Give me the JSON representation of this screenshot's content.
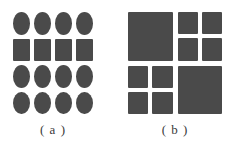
{
  "figure": {
    "background_color": "#ffffff",
    "shape_color": "#4a4a4a",
    "panels": [
      {
        "id": "a",
        "caption": "( a )",
        "description": "regular 4x4 lattice of shapes",
        "columns": 4,
        "rows": 4,
        "cells": [
          [
            "circle",
            "circle",
            "circle",
            "circle"
          ],
          [
            "square",
            "square",
            "square",
            "square"
          ],
          [
            "circle",
            "circle",
            "circle",
            "circle"
          ],
          [
            "circle",
            "circle",
            "circle",
            "circle"
          ]
        ]
      },
      {
        "id": "b",
        "caption": "( b )",
        "description": "quadtree subdivision of a square into four quadrants, two of which are further split into four sub-blocks",
        "quadrants": [
          {
            "position": "top-left",
            "type": "leaf",
            "children": []
          },
          {
            "position": "top-right",
            "type": "split",
            "children": [
              "top-left",
              "top-right",
              "bottom-left",
              "bottom-right"
            ]
          },
          {
            "position": "bottom-left",
            "type": "split",
            "children": [
              "top-left",
              "top-right",
              "bottom-left",
              "bottom-right"
            ]
          },
          {
            "position": "bottom-right",
            "type": "leaf",
            "children": []
          }
        ]
      }
    ]
  },
  "chart_data": {
    "type": "diagram",
    "title": "",
    "subtitle": "",
    "panels": [
      {
        "label": "( a )",
        "kind": "shape-lattice",
        "grid": [
          4,
          4
        ],
        "shape_rows": [
          "circle",
          "square",
          "circle",
          "circle"
        ],
        "total_shapes": 16,
        "circle_count": 12,
        "square_count": 4
      },
      {
        "label": "( b )",
        "kind": "quadtree",
        "depth": 2,
        "leaf_count": 10,
        "split_quadrants": [
          "top-right",
          "bottom-left"
        ],
        "leaf_quadrants": [
          "top-left",
          "bottom-right"
        ]
      }
    ],
    "xlabel": "",
    "ylabel": "",
    "legend": []
  }
}
